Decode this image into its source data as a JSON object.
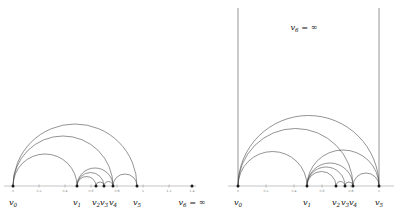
{
  "figure": {
    "title": "",
    "stroke_color": "#3a3a3a",
    "axis_color": "#8a8a8a",
    "label_color": "#111111",
    "tick_color": "#6e6e6e"
  },
  "panels": [
    {
      "id": "left-panel",
      "name": "left-diagram",
      "axis": {
        "x_start": 4,
        "x_end": 196,
        "y": 186,
        "ticks": [
          {
            "value": "0",
            "x": 13
          },
          {
            "value": "0.2",
            "x": 39
          },
          {
            "value": "0.4",
            "x": 65
          },
          {
            "value": "0.6",
            "x": 91
          },
          {
            "value": "0.8",
            "x": 117
          },
          {
            "value": "1",
            "x": 143
          },
          {
            "value": "1.2",
            "x": 169
          },
          {
            "value": "1.4",
            "x": 192
          }
        ]
      },
      "vertices": [
        {
          "label": "v",
          "sub": "0",
          "x": 13,
          "y": 186,
          "label_y": 205
        },
        {
          "label": "v",
          "sub": "1",
          "x": 77,
          "y": 186,
          "label_y": 205
        },
        {
          "label": "v",
          "sub": "2",
          "x": 96,
          "y": 186,
          "label_y": 205
        },
        {
          "label": "v",
          "sub": "3",
          "x": 104,
          "y": 186,
          "label_y": 205
        },
        {
          "label": "v",
          "sub": "4",
          "x": 113,
          "y": 186,
          "label_y": 205
        },
        {
          "label": "v",
          "sub": "5",
          "x": 137,
          "y": 186,
          "label_y": 205
        }
      ],
      "infinity_vertex": {
        "label": "v",
        "sub": "6",
        "equals": " = ",
        "symbol": "∞",
        "x": 192,
        "dot_y": 186,
        "label_y": 205
      },
      "arcs": [
        {
          "from": 13,
          "to": 137,
          "name": "arc-v0-v5"
        },
        {
          "from": 13,
          "to": 113,
          "name": "arc-v0-v4"
        },
        {
          "from": 13,
          "to": 77,
          "name": "arc-v0-v1"
        },
        {
          "from": 77,
          "to": 113,
          "name": "arc-v1-v4"
        },
        {
          "from": 77,
          "to": 104,
          "name": "arc-v1-v3"
        },
        {
          "from": 77,
          "to": 96,
          "name": "arc-v1-v2"
        },
        {
          "from": 96,
          "to": 104,
          "name": "arc-v2-v3"
        },
        {
          "from": 104,
          "to": 113,
          "name": "arc-v3-v4"
        },
        {
          "from": 113,
          "to": 137,
          "name": "arc-v4-v5"
        }
      ],
      "vertical_lines": []
    },
    {
      "id": "right-panel",
      "name": "right-diagram",
      "axis": {
        "x_start": 228,
        "x_end": 394,
        "y": 186,
        "ticks": [
          {
            "value": "0",
            "x": 238
          },
          {
            "value": "0.2",
            "x": 266
          },
          {
            "value": "0.4",
            "x": 294
          },
          {
            "value": "0.6",
            "x": 322
          },
          {
            "value": "0.8",
            "x": 351
          },
          {
            "value": "1",
            "x": 379
          }
        ]
      },
      "vertices": [
        {
          "label": "v",
          "sub": "0",
          "x": 238,
          "y": 186,
          "label_y": 205
        },
        {
          "label": "v",
          "sub": "1",
          "x": 307,
          "y": 186,
          "label_y": 205
        },
        {
          "label": "v",
          "sub": "2",
          "x": 336,
          "y": 186,
          "label_y": 205
        },
        {
          "label": "v",
          "sub": "3",
          "x": 345,
          "y": 186,
          "label_y": 205
        },
        {
          "label": "v",
          "sub": "4",
          "x": 353,
          "y": 186,
          "label_y": 205
        },
        {
          "label": "v",
          "sub": "5",
          "x": 379,
          "y": 186,
          "label_y": 205
        }
      ],
      "infinity_label": {
        "label": "v",
        "sub": "6",
        "equals": " = ",
        "symbol": "∞",
        "x": 304,
        "y": 30
      },
      "arcs": [
        {
          "from": 238,
          "to": 379,
          "name": "arc-v0-v5"
        },
        {
          "from": 238,
          "to": 353,
          "name": "arc-v0-v4"
        },
        {
          "from": 238,
          "to": 307,
          "name": "arc-v0-v1"
        },
        {
          "from": 307,
          "to": 379,
          "name": "arc-v1-v5"
        },
        {
          "from": 307,
          "to": 353,
          "name": "arc-v1-v4"
        },
        {
          "from": 307,
          "to": 345,
          "name": "arc-v1-v3"
        },
        {
          "from": 307,
          "to": 336,
          "name": "arc-v1-v2"
        },
        {
          "from": 336,
          "to": 345,
          "name": "arc-v2-v3"
        },
        {
          "from": 345,
          "to": 353,
          "name": "arc-v3-v4"
        },
        {
          "from": 353,
          "to": 379,
          "name": "arc-v4-v5"
        }
      ],
      "vertical_lines": [
        {
          "x": 238,
          "y_top": 8,
          "y_bottom": 186,
          "name": "vline-v0-infinity"
        },
        {
          "x": 379,
          "y_top": 8,
          "y_bottom": 186,
          "name": "vline-v5-infinity"
        }
      ]
    }
  ]
}
